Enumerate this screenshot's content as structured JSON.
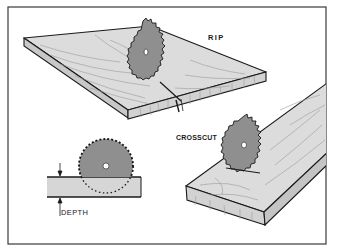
{
  "figure": {
    "type": "illustration",
    "colors": {
      "frame": "#3a3a3a",
      "outline": "#1a1a1a",
      "wood_top": "#d9d9d9",
      "wood_face": "#cfcfcf",
      "blade": "#8f8f8f",
      "grain": "#9a9a9a",
      "background": "#ffffff"
    },
    "panels": [
      {
        "id": "rip",
        "label": "RIP"
      },
      {
        "id": "crosscut",
        "label": "CROSSCUT"
      },
      {
        "id": "depth",
        "label": "DEPTH"
      }
    ]
  },
  "labels": {
    "rip": "RIP",
    "crosscut": "CROSSCUT",
    "depth": "DEPTH"
  }
}
